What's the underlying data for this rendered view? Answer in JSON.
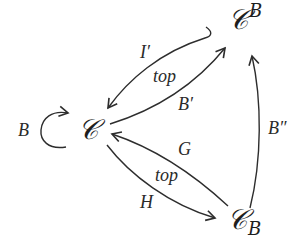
{
  "diagram": {
    "type": "commutative-diagram",
    "nodes": {
      "C": {
        "symbol": "𝒞",
        "sup": "",
        "sub": ""
      },
      "CB_sup": {
        "symbol": "𝒞",
        "sup": "B",
        "sub": ""
      },
      "CB_sub": {
        "symbol": "𝒞",
        "sup": "",
        "sub": "B"
      }
    },
    "edges": [
      {
        "id": "loop",
        "from": "C",
        "to": "C",
        "label": "B"
      },
      {
        "id": "i-prime",
        "from": "C^B",
        "to": "C",
        "label": "I′"
      },
      {
        "id": "b-prime",
        "from": "C",
        "to": "C^B",
        "label": "B′"
      },
      {
        "id": "b-double-prime",
        "from": "C_B",
        "to": "C^B",
        "label": "B″"
      },
      {
        "id": "g",
        "from": "C_B",
        "to": "C",
        "label": "G"
      },
      {
        "id": "h",
        "from": "C",
        "to": "C_B",
        "label": "H"
      }
    ],
    "annotations": {
      "top_upper": "top",
      "top_lower": "top"
    },
    "colors": {
      "ink": "#2d2d2d",
      "background": "#ffffff"
    }
  }
}
